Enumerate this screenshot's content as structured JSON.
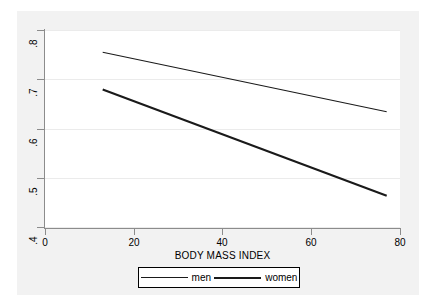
{
  "chart_data": {
    "type": "line",
    "title": "",
    "subtitle": "",
    "xlabel": "BODY MASS INDEX",
    "ylabel": "",
    "xlim": [
      0,
      80
    ],
    "ylim": [
      0.4,
      0.8
    ],
    "xticks": [
      "0",
      "20",
      "40",
      "60",
      "80"
    ],
    "xtick_values": [
      0,
      20,
      40,
      60,
      80
    ],
    "yticks": [
      ".4",
      ".5",
      ".6",
      ".7",
      ".8"
    ],
    "ytick_values": [
      0.4,
      0.5,
      0.6,
      0.7,
      0.8
    ],
    "grid": "horizontal",
    "legend_position": "bottom-center",
    "series": [
      {
        "name": "men",
        "style": "thin",
        "color": "#1a1a1a",
        "x": [
          13,
          77
        ],
        "y": [
          0.755,
          0.635
        ]
      },
      {
        "name": "women",
        "style": "thick",
        "color": "#1a1a1a",
        "x": [
          13,
          77
        ],
        "y": [
          0.68,
          0.465
        ]
      }
    ],
    "legend": [
      {
        "label": "men",
        "style": "thin"
      },
      {
        "label": "women",
        "style": "thick"
      }
    ]
  },
  "colors": {
    "plot_region_background": "#f2f2f2",
    "graph_background": "#ffffff",
    "axis": "#8c8c8c",
    "gridline": "#ebebeb",
    "line": "#1a1a1a"
  }
}
